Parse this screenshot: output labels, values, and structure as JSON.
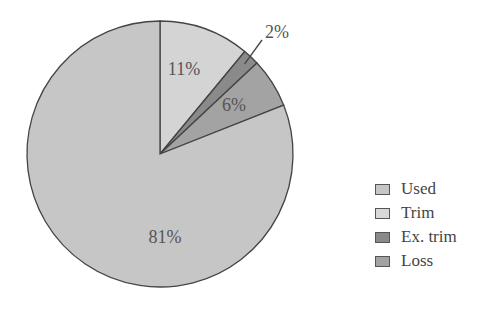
{
  "chart_data": {
    "type": "pie",
    "title": "",
    "start_angle_deg": 0,
    "direction": "clockwise",
    "slices": [
      {
        "name": "Trim",
        "value": 11,
        "label": "11%",
        "color": "#d4d4d4"
      },
      {
        "name": "Ex. trim",
        "value": 2,
        "label": "2%",
        "color": "#8a8a8a"
      },
      {
        "name": "Loss",
        "value": 6,
        "label": "6%",
        "color": "#a3a3a3"
      },
      {
        "name": "Used",
        "value": 81,
        "label": "81%",
        "color": "#c6c6c6"
      }
    ],
    "legend": {
      "position": "right",
      "entries": [
        {
          "label": "Used",
          "color": "#c6c6c6"
        },
        {
          "label": "Trim",
          "color": "#d8d8d8"
        },
        {
          "label": "Ex. trim",
          "color": "#8a8a8a"
        },
        {
          "label": "Loss",
          "color": "#a3a3a3"
        }
      ]
    }
  }
}
